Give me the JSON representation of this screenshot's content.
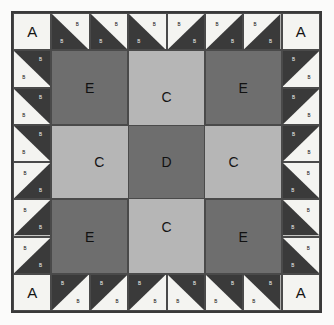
{
  "diagram": {
    "type": "quilt-block-piecing-diagram",
    "background_color": "#fbfbfa",
    "border_color": "#3a3a3a"
  },
  "palette": {
    "light": "#f4f4f1",
    "dark": "#3a3a3a",
    "medium_light": "#b6b6b6",
    "medium": "#6e6e6e",
    "outline": "#4a4a4a"
  },
  "labels": {
    "A": "A",
    "B": "B",
    "C": "C",
    "D": "D",
    "E": "E"
  },
  "patches": {
    "corner_square": "A",
    "triangle": "B",
    "rectangle": "C",
    "center_square": "D",
    "large_square": "E"
  },
  "layout": {
    "grid_units": 8,
    "corner_blocks": 4,
    "edge_rectangles": 4,
    "center_squares": 1,
    "hst_units_total": 24,
    "corner_squares_total": 4,
    "large_squares_total": 4
  }
}
